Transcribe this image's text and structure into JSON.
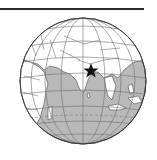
{
  "map": {
    "type": "orthographic globe",
    "region_shown": "Asia, Indian Ocean, East Africa, Europe",
    "marker": {
      "symbol": "star",
      "location": "Bangladesh / Bay of Bengal region"
    },
    "colors": {
      "ocean": "#b9b9b9",
      "land": "#ffffff",
      "outline": "#4a4a4a",
      "graticule": "#6e6e6e",
      "marker": "#111111",
      "rule": "#2a2a2a"
    }
  }
}
